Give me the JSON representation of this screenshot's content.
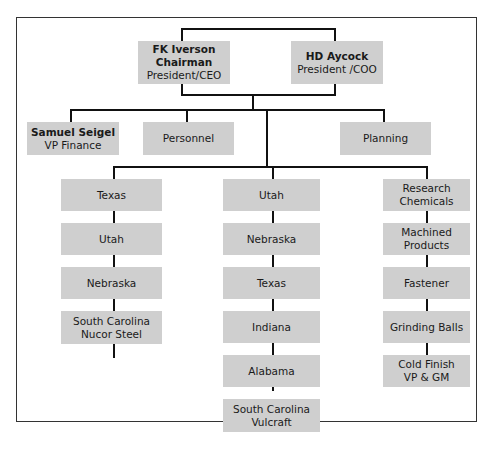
{
  "executives": [
    {
      "name": "FK Iverson",
      "title_line1": "Chairman",
      "title_line2": "President/CEO"
    },
    {
      "name": "HD Aycock",
      "title_line1": "President /COO"
    }
  ],
  "staff": [
    {
      "name": "Samuel Seigel",
      "title": "VP Finance"
    },
    {
      "label": "Personnel"
    },
    {
      "label": "Planning"
    }
  ],
  "columns": [
    {
      "units": [
        {
          "lines": [
            "Texas"
          ]
        },
        {
          "lines": [
            "Utah"
          ]
        },
        {
          "lines": [
            "Nebraska"
          ]
        },
        {
          "lines": [
            "South Carolina",
            "Nucor Steel"
          ]
        }
      ]
    },
    {
      "units": [
        {
          "lines": [
            "Utah"
          ]
        },
        {
          "lines": [
            "Nebraska"
          ]
        },
        {
          "lines": [
            "Texas"
          ]
        },
        {
          "lines": [
            "Indiana"
          ]
        },
        {
          "lines": [
            "Alabama"
          ]
        },
        {
          "lines": [
            "South Carolina",
            "Vulcraft"
          ]
        }
      ]
    },
    {
      "units": [
        {
          "lines": [
            "Research",
            "Chemicals"
          ]
        },
        {
          "lines": [
            "Machined",
            "Products"
          ]
        },
        {
          "lines": [
            "Fastener"
          ]
        },
        {
          "lines": [
            "Grinding Balls"
          ]
        },
        {
          "lines": [
            "Cold Finish",
            "VP & GM"
          ]
        }
      ]
    }
  ],
  "colors": {
    "box_fill": "#cfcfcf",
    "line": "#111111",
    "frame": "#333333"
  }
}
